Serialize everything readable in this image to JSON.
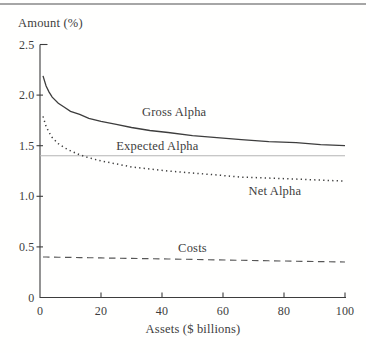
{
  "figure": {
    "background": "#fffffe",
    "ink_color": "#3d3d3d",
    "light_line_color": "#b4b4b4",
    "top_rule_color": "#a6a6a6"
  },
  "chart_data": {
    "type": "line",
    "title": "",
    "ylabel": "Amount (%)",
    "xlabel": "Assets ($ billions)",
    "xlim": [
      0,
      100
    ],
    "ylim": [
      0,
      2.5
    ],
    "grid": false,
    "legend": "inline-labels",
    "x_ticks": {
      "values": [
        0,
        20,
        40,
        60,
        80,
        100
      ],
      "labels": [
        "0",
        "20",
        "40",
        "60",
        "80",
        "100"
      ]
    },
    "y_ticks": {
      "values": [
        0,
        0.5,
        1.0,
        1.5,
        2.0,
        2.5
      ],
      "labels": [
        "0",
        "0.5",
        "1.0",
        "1.5",
        "2.0",
        "2.5"
      ]
    },
    "series": [
      {
        "name": "Gross Alpha",
        "style": "solid",
        "x": [
          1,
          2,
          3,
          4,
          6,
          8,
          10,
          13,
          16,
          20,
          25,
          30,
          36,
          42,
          50,
          58,
          66,
          75,
          84,
          92,
          100
        ],
        "y": [
          2.19,
          2.09,
          2.03,
          1.98,
          1.92,
          1.88,
          1.84,
          1.81,
          1.77,
          1.74,
          1.71,
          1.68,
          1.65,
          1.63,
          1.6,
          1.58,
          1.56,
          1.54,
          1.53,
          1.51,
          1.5
        ],
        "label_anchor": {
          "x": 44,
          "y": 1.83
        }
      },
      {
        "name": "Expected Alpha",
        "style": "solid-light",
        "x": [
          0,
          100
        ],
        "y": [
          1.4,
          1.4
        ],
        "label_anchor": {
          "x": 38.5,
          "y": 1.5
        }
      },
      {
        "name": "Net Alpha",
        "style": "dotted",
        "x": [
          1,
          2,
          3,
          4,
          6,
          8,
          10,
          13,
          16,
          20,
          25,
          30,
          36,
          42,
          50,
          58,
          66,
          75,
          84,
          92,
          100
        ],
        "y": [
          1.79,
          1.69,
          1.63,
          1.58,
          1.52,
          1.48,
          1.45,
          1.41,
          1.38,
          1.35,
          1.32,
          1.29,
          1.27,
          1.25,
          1.23,
          1.21,
          1.19,
          1.18,
          1.17,
          1.16,
          1.15
        ],
        "label_anchor": {
          "x": 77,
          "y": 1.05
        }
      },
      {
        "name": "Costs",
        "style": "dashed",
        "x": [
          1,
          2,
          3,
          4,
          6,
          8,
          10,
          13,
          16,
          20,
          25,
          30,
          36,
          42,
          50,
          58,
          66,
          75,
          84,
          92,
          100
        ],
        "y": [
          0.4,
          0.4,
          0.399,
          0.399,
          0.398,
          0.397,
          0.396,
          0.394,
          0.393,
          0.391,
          0.388,
          0.386,
          0.383,
          0.38,
          0.376,
          0.372,
          0.368,
          0.363,
          0.359,
          0.355,
          0.351
        ],
        "label_anchor": {
          "x": 50,
          "y": 0.485
        }
      }
    ]
  }
}
